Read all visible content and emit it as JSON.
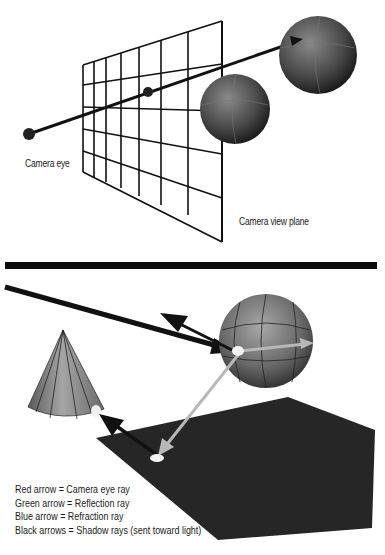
{
  "top_panel": {
    "title": "Camera eye ray through view plane",
    "labels": {
      "camera_eye": "Camera eye",
      "view_plane": "Camera view plane"
    },
    "grid": {
      "columns": 7,
      "rows": 6
    }
  },
  "bottom_panel": {
    "legend": [
      "Red arrow = Camera eye ray",
      "Green arrow = Reflection ray",
      "Blue arrow = Refraction ray",
      "Black arrows = Shadow rays (sent toward light)"
    ],
    "objects": [
      "sphere",
      "cone",
      "ground-plane"
    ]
  },
  "colors": {
    "background": "#ffffff",
    "lines": "#111111",
    "divider": "#0a0a0a",
    "plane": "#262626",
    "light_ray": "#b8b8b8",
    "hit_spot": "#f2f2f2"
  }
}
